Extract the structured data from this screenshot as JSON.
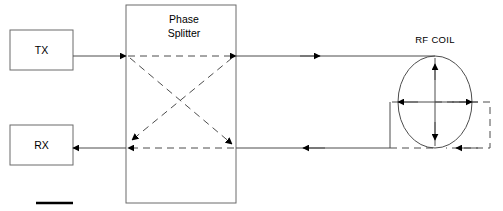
{
  "diagram": {
    "background": "#ffffff",
    "stroke_color": "#4d4d4d",
    "accent_color": "#000000",
    "blocks": [
      {
        "id": "tx",
        "label": "TX",
        "x": 10,
        "y": 30,
        "w": 63,
        "h": 40
      },
      {
        "id": "rx",
        "label": "RX",
        "x": 10,
        "y": 125,
        "w": 63,
        "h": 40
      },
      {
        "id": "phase_splitter",
        "label_line1": "Phase",
        "label_line2": "Splitter",
        "x": 126,
        "y": 5,
        "w": 110,
        "h": 198
      }
    ],
    "coil": {
      "label": "RF COIL",
      "cx": 435,
      "cy": 102,
      "rx": 37,
      "ry": 46
    },
    "legend": {
      "swatch_label": ""
    }
  }
}
